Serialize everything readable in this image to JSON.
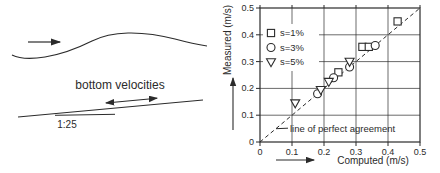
{
  "figure": {
    "background": "#ffffff",
    "line_color": "#2b2b2b"
  },
  "left_diagram": {
    "surface_flow_arrow": "arrow pointing right above wave profile",
    "label_bottom_velocities": "bottom velocities",
    "bottom_velocity_arrow": "double-headed arrow along sloping bed",
    "slope_label": "1:25"
  },
  "chart_data": {
    "type": "scatter",
    "title": "",
    "xlabel": "Computed (m/s)",
    "ylabel": "Measured (m/s)",
    "xlim": [
      0,
      0.5
    ],
    "ylim": [
      0,
      0.5
    ],
    "xticks": [
      0,
      0.1,
      0.2,
      0.3,
      0.4,
      0.5
    ],
    "yticks": [
      0,
      0.1,
      0.2,
      0.3,
      0.4,
      0.5
    ],
    "grid": true,
    "legend_position": "upper-left-inside",
    "series": [
      {
        "name": "s=1%",
        "marker": "square",
        "points": [
          [
            0.245,
            0.26
          ],
          [
            0.32,
            0.355
          ],
          [
            0.34,
            0.355
          ],
          [
            0.43,
            0.45
          ]
        ]
      },
      {
        "name": "s=3%",
        "marker": "circle",
        "points": [
          [
            0.18,
            0.18
          ],
          [
            0.23,
            0.24
          ],
          [
            0.28,
            0.28
          ],
          [
            0.36,
            0.36
          ]
        ]
      },
      {
        "name": "s=5%",
        "marker": "triangle-down",
        "points": [
          [
            0.11,
            0.145
          ],
          [
            0.19,
            0.195
          ],
          [
            0.215,
            0.225
          ],
          [
            0.28,
            0.3
          ]
        ]
      }
    ],
    "reference_line": {
      "label": "line of perfect agreement",
      "from": [
        0,
        0
      ],
      "to": [
        0.5,
        0.5
      ],
      "style": "dashed"
    }
  }
}
